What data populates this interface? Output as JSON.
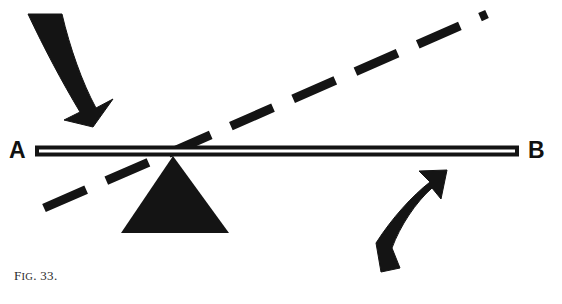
{
  "figure": {
    "caption_prefix": "F",
    "caption_small": "IG",
    "caption_suffix": ". 33.",
    "caption_full": "Fig. 33.",
    "background_color": "#ffffff",
    "ink_color": "#141414"
  },
  "labels": {
    "left_end": "A",
    "right_end": "B"
  },
  "diagram": {
    "type": "lever-fulcrum-mechanics",
    "beam": {
      "name": "lever-beam",
      "x1": 35,
      "y1": 151,
      "x2": 519,
      "y2": 151,
      "thickness": 11,
      "style": "outlined-bar-with-white-core",
      "outline_color": "#141414",
      "core_color": "#ffffff"
    },
    "fulcrum": {
      "name": "fulcrum-triangle",
      "apex_x": 173,
      "apex_y": 156,
      "base_left_x": 121,
      "base_right_x": 229,
      "base_y": 233,
      "fill_color": "#141414"
    },
    "dashed_line": {
      "name": "tilted-position-dashed-line",
      "x1": 44,
      "y1": 208,
      "x2": 487,
      "y2": 14,
      "stroke_width": 9,
      "dash_length": 46,
      "gap_length": 22,
      "color": "#141414"
    },
    "arrow_down": {
      "name": "applied-force-arrow-down",
      "direction": "down-right",
      "tail_x": 44,
      "tail_y": 20,
      "tip_x": 92,
      "tip_y": 126,
      "color": "#141414"
    },
    "arrow_up": {
      "name": "resistance-force-arrow-up",
      "direction": "up-right",
      "tail_x": 387,
      "tail_y": 272,
      "tip_x": 446,
      "tip_y": 171,
      "color": "#141414"
    }
  }
}
